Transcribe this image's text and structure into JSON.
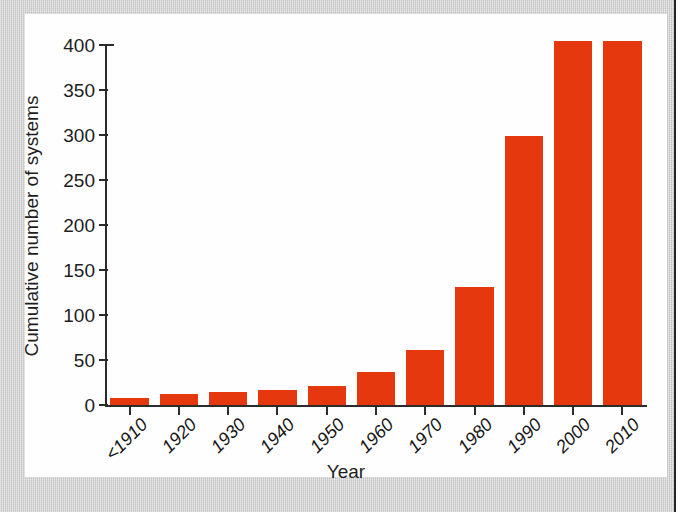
{
  "figure": {
    "panel_background": "#fefefe",
    "page_background": "#cdcdcd",
    "bar_color": "#e6380e",
    "axis_color": "#2b2b2b"
  },
  "chart_data": {
    "type": "bar",
    "title": "",
    "xlabel": "Year",
    "ylabel": "Cumulative number of systems",
    "categories": [
      "<1910",
      "1920",
      "1930",
      "1940",
      "1950",
      "1960",
      "1970",
      "1980",
      "1990",
      "2000",
      "2010"
    ],
    "values": [
      8,
      12,
      15,
      17,
      21,
      37,
      61,
      131,
      299,
      404,
      404
    ],
    "ylim": [
      0,
      400
    ],
    "yticks": [
      0,
      50,
      100,
      150,
      200,
      250,
      300,
      350,
      400
    ],
    "ytick_labels": [
      "0",
      "50",
      "100",
      "150",
      "200",
      "250",
      "300",
      "350",
      "400"
    ],
    "xtick_labels": [
      "<1910",
      "1920",
      "1930",
      "1940",
      "1950",
      "1960",
      "1970",
      "1980",
      "1990",
      "2000",
      "2010"
    ],
    "grid": false,
    "legend": null,
    "legend_position": "none",
    "annotations": [],
    "xtick_label_rotation_deg": -45,
    "bar_count": 11
  }
}
